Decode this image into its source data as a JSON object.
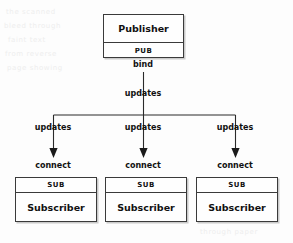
{
  "diagram": {
    "type": "pub-sub-topology",
    "publisher": {
      "title": "Publisher",
      "socket": "PUB"
    },
    "subscribers": [
      {
        "socket": "SUB",
        "title": "Subscriber"
      },
      {
        "socket": "SUB",
        "title": "Subscriber"
      },
      {
        "socket": "SUB",
        "title": "Subscriber"
      }
    ],
    "edges": {
      "bind_label": "bind",
      "trunk_label": "updates",
      "branch_labels": [
        "updates",
        "updates",
        "updates"
      ],
      "connect_labels": [
        "connect",
        "connect",
        "connect"
      ]
    },
    "colors": {
      "line": "#2a2a2a",
      "border": "#3a3a3a",
      "text": "#111111",
      "box_fill": "#fefefe",
      "background": "#fdfdfd"
    }
  },
  "background_artifacts": [
    "the scanned",
    "bleed through",
    "faint text",
    "from reverse",
    "page showing",
    "through paper"
  ]
}
